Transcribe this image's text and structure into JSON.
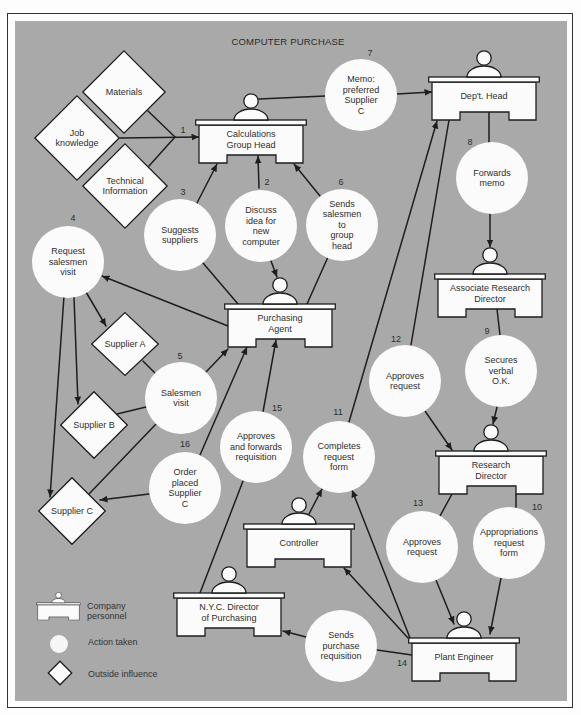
{
  "title": "COMPUTER PURCHASE",
  "step_one_label": "1",
  "personnel": [
    {
      "id": "calculations-group-head",
      "label": "Calculations\nGroup Head"
    },
    {
      "id": "dept-head",
      "label": "Dep't. Head"
    },
    {
      "id": "purchasing-agent",
      "label": "Purchasing\nAgent"
    },
    {
      "id": "associate-research-director",
      "label": "Associate Research\nDirector"
    },
    {
      "id": "research-director",
      "label": "Research\nDirector"
    },
    {
      "id": "controller",
      "label": "Controller"
    },
    {
      "id": "nyc-director-of-purchasing",
      "label": "N.Y.C. Director\nof Purchasing"
    },
    {
      "id": "plant-engineer",
      "label": "Plant Engineer"
    }
  ],
  "actions": [
    {
      "step": "2",
      "label": "Discuss\nidea for\nnew\ncomputer"
    },
    {
      "step": "3",
      "label": "Suggests\nsuppliers"
    },
    {
      "step": "4",
      "label": "Request\nsalesmen\nvisit"
    },
    {
      "step": "5",
      "label": "Salesmen\nvisit"
    },
    {
      "step": "6",
      "label": "Sends\nsalesmen\nto\ngroup\nhead"
    },
    {
      "step": "7",
      "label": "Memo:\npreferred\nSupplier\nC"
    },
    {
      "step": "8",
      "label": "Forwards\nmemo"
    },
    {
      "step": "9",
      "label": "Secures\nverbal\nO.K."
    },
    {
      "step": "10",
      "label": "Appropriations\nrequest\nform"
    },
    {
      "step": "11",
      "label": "Completes\nrequest\nform"
    },
    {
      "step": "12",
      "label": "Approves\nrequest"
    },
    {
      "step": "13",
      "label": "Approves\nrequest"
    },
    {
      "step": "14",
      "label": "Sends\npurchase\nrequisition"
    },
    {
      "step": "15",
      "label": "Approves\nand forwards\nrequisition"
    },
    {
      "step": "16",
      "label": "Order\nplaced\nSupplier\nC"
    }
  ],
  "outside_influences": [
    {
      "id": "materials",
      "label": "Materials"
    },
    {
      "id": "job-knowledge",
      "label": "Job\nknowledge"
    },
    {
      "id": "technical-information",
      "label": "Technical\nInformation"
    },
    {
      "id": "supplier-a",
      "label": "Supplier A"
    },
    {
      "id": "supplier-b",
      "label": "Supplier B"
    },
    {
      "id": "supplier-c",
      "label": "Supplier C"
    }
  ],
  "legend": [
    {
      "symbol": "desk",
      "label": "Company\npersonnel"
    },
    {
      "symbol": "circle",
      "label": "Action taken"
    },
    {
      "symbol": "diamond",
      "label": "Outside influence"
    }
  ],
  "edges": [
    {
      "from": "Materials",
      "to": "Calculations Group Head",
      "step": "1",
      "arrow": true
    },
    {
      "from": "Job knowledge",
      "to": "Calculations Group Head",
      "step": "1",
      "arrow": true
    },
    {
      "from": "Technical Information",
      "to": "Calculations Group Head",
      "step": "1",
      "arrow": true
    },
    {
      "from": "Discuss idea for new computer",
      "to": "Calculations Group Head",
      "arrow": true
    },
    {
      "from": "Discuss idea for new computer",
      "to": "Purchasing Agent",
      "arrow": true
    },
    {
      "from": "Purchasing Agent",
      "to": "Suggests suppliers",
      "arrow": false
    },
    {
      "from": "Suggests suppliers",
      "to": "Calculations Group Head",
      "arrow": true
    },
    {
      "from": "Purchasing Agent",
      "to": "Request salesmen visit",
      "arrow": true
    },
    {
      "from": "Request salesmen visit",
      "to": "Supplier A",
      "arrow": true
    },
    {
      "from": "Request salesmen visit",
      "to": "Supplier B",
      "arrow": true
    },
    {
      "from": "Request salesmen visit",
      "to": "Supplier C",
      "arrow": true
    },
    {
      "from": "Supplier A",
      "to": "Salesmen visit",
      "arrow": false
    },
    {
      "from": "Supplier B",
      "to": "Salesmen visit",
      "arrow": false
    },
    {
      "from": "Supplier C",
      "to": "Salesmen visit",
      "arrow": false
    },
    {
      "from": "Salesmen visit",
      "to": "Purchasing Agent",
      "arrow": true
    },
    {
      "from": "Purchasing Agent",
      "to": "Sends salesmen to group head",
      "arrow": false
    },
    {
      "from": "Sends salesmen to group head",
      "to": "Calculations Group Head",
      "arrow": true
    },
    {
      "from": "Calculations Group Head",
      "to": "Memo: preferred Supplier C",
      "arrow": false
    },
    {
      "from": "Memo: preferred Supplier C",
      "to": "Dep't. Head",
      "arrow": true
    },
    {
      "from": "Dep't. Head",
      "to": "Forwards memo",
      "arrow": false
    },
    {
      "from": "Forwards memo",
      "to": "Associate Research Director",
      "arrow": true
    },
    {
      "from": "Associate Research Director",
      "to": "Secures verbal O.K.",
      "arrow": false
    },
    {
      "from": "Secures verbal O.K.",
      "to": "Research Director",
      "arrow": true
    },
    {
      "from": "Research Director",
      "to": "Appropriations request form",
      "arrow": false
    },
    {
      "from": "Appropriations request form",
      "to": "Plant Engineer",
      "arrow": true
    },
    {
      "from": "Plant Engineer",
      "to": "Completes request form",
      "arrow": true
    },
    {
      "from": "Plant Engineer",
      "to": "Controller",
      "arrow": true
    },
    {
      "from": "Controller",
      "to": "Completes request form",
      "arrow": true
    },
    {
      "from": "Completes request form",
      "to": "Dep't. Head",
      "arrow": true
    },
    {
      "from": "Dep't. Head",
      "to": "Approves request (12)",
      "arrow": false
    },
    {
      "from": "Approves request (12)",
      "to": "Research Director",
      "arrow": true
    },
    {
      "from": "Research Director",
      "to": "Approves request (13)",
      "arrow": false
    },
    {
      "from": "Approves request (13)",
      "to": "Plant Engineer",
      "arrow": true
    },
    {
      "from": "Plant Engineer",
      "to": "Sends purchase requisition",
      "arrow": false
    },
    {
      "from": "Sends purchase requisition",
      "to": "N.Y.C. Director of Purchasing",
      "arrow": true
    },
    {
      "from": "N.Y.C. Director of Purchasing",
      "to": "Approves and forwards requisition",
      "arrow": false
    },
    {
      "from": "Approves and forwards requisition",
      "to": "Purchasing Agent",
      "arrow": true
    },
    {
      "from": "Order placed Supplier C",
      "to": "Purchasing Agent",
      "arrow": true
    },
    {
      "from": "Order placed Supplier C",
      "to": "Supplier C",
      "arrow": true
    }
  ],
  "colors": {
    "panel": "#a9a9a9",
    "shape_fill": "#fbfbfb",
    "stroke": "#1e1e1e",
    "text": "#2e2e2e"
  }
}
